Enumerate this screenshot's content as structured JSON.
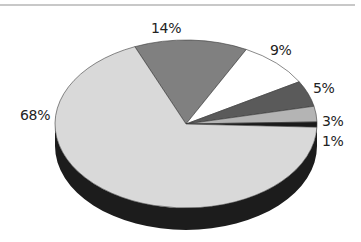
{
  "chart_data": {
    "type": "pie",
    "style": "3d",
    "title": "",
    "labels": [
      "68%",
      "14%",
      "9%",
      "5%",
      "3%",
      "1%"
    ],
    "values": [
      68,
      14,
      9,
      5,
      3,
      1
    ],
    "colors": [
      "#d9d9d9",
      "#808080",
      "#ffffff",
      "#5a5a5a",
      "#b4b4b4",
      "#1a1a1a"
    ],
    "legend": false
  },
  "labels": {
    "l68": "68%",
    "l14": "14%",
    "l9": "9%",
    "l5": "5%",
    "l3": "3%",
    "l1": "1%"
  }
}
